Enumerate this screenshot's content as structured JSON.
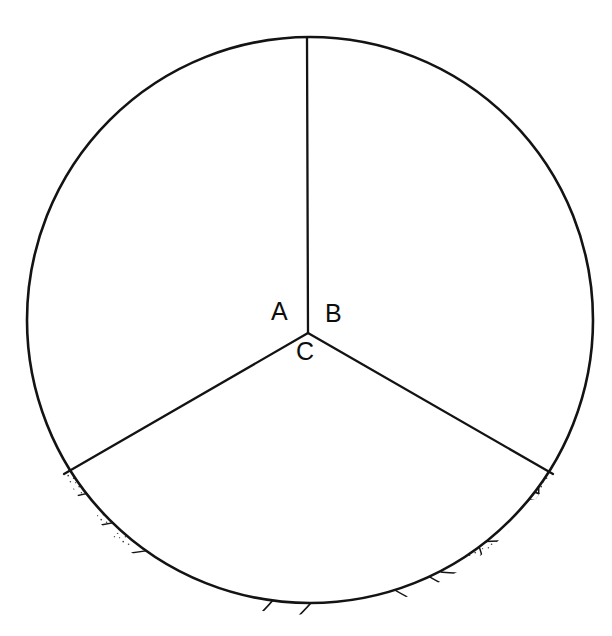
{
  "figure": {
    "kind": "microscopy-field-diagram",
    "title": "",
    "caption": "",
    "background_color": "#ffffff",
    "ink_color": "#131313",
    "field": {
      "shape": "circle",
      "center_x": 310,
      "center_y": 320,
      "radius": 284,
      "stroke_width": 2.6
    },
    "divider": {
      "junction_x": 308,
      "junction_y": 333,
      "arm_up_angle_deg": -90,
      "arm_lower_left_angle_deg": 150,
      "arm_lower_right_angle_deg": 30
    },
    "sectors": [
      {
        "id": "A",
        "label": "A",
        "label_x": 279,
        "label_y": 319,
        "content": "rod-shaped-bacilli",
        "description": "Segmented stippled rod-shaped bacilli scattered across the upper-left sector, some branched and curved.",
        "object_count": 28
      },
      {
        "id": "B",
        "label": "B",
        "label_x": 331,
        "label_y": 321,
        "content": "round-oval-cells",
        "description": "Round and oval stippled cells in the upper-right sector, several in budding pairs.",
        "object_count": 16
      },
      {
        "id": "C",
        "label": "C",
        "label_x": 301,
        "label_y": 359,
        "content": "septate-hyphae-with-conidiophore",
        "description": "Septate filamentous hyphae crossing the lower sector with a central branching conidiophore bearing four chains of conidia.",
        "hypha_count": 7,
        "conidia_chain_count": 4
      }
    ],
    "bacilli": [
      {
        "cx": 152,
        "cy": 113,
        "len": 26,
        "w": 10,
        "rot": -66,
        "seg": 3
      },
      {
        "cx": 213,
        "cy": 112,
        "len": 36,
        "w": 11,
        "rot": -8,
        "seg": 4
      },
      {
        "cx": 190,
        "cy": 134,
        "len": 62,
        "w": 12,
        "rot": 8,
        "seg": 6
      },
      {
        "cx": 232,
        "cy": 119,
        "len": 38,
        "w": 12,
        "rot": -62,
        "seg": 4
      },
      {
        "cx": 265,
        "cy": 118,
        "len": 50,
        "w": 12,
        "rot": -75,
        "seg": 5
      },
      {
        "cx": 284,
        "cy": 132,
        "len": 54,
        "w": 12,
        "rot": -80,
        "seg": 5
      },
      {
        "cx": 103,
        "cy": 159,
        "len": 40,
        "w": 12,
        "rot": -16,
        "seg": 4
      },
      {
        "cx": 120,
        "cy": 176,
        "len": 40,
        "w": 12,
        "rot": 60,
        "seg": 4
      },
      {
        "cx": 221,
        "cy": 182,
        "len": 36,
        "w": 12,
        "rot": -30,
        "seg": 4
      },
      {
        "cx": 160,
        "cy": 200,
        "len": 36,
        "w": 11,
        "rot": 72,
        "seg": 4
      },
      {
        "cx": 159,
        "cy": 226,
        "len": 30,
        "w": 11,
        "rot": 84,
        "seg": 3
      },
      {
        "cx": 212,
        "cy": 210,
        "len": 24,
        "w": 10,
        "rot": 66,
        "seg": 3
      },
      {
        "cx": 240,
        "cy": 200,
        "len": 38,
        "w": 12,
        "rot": 34,
        "seg": 4
      },
      {
        "cx": 264,
        "cy": 206,
        "len": 44,
        "w": 12,
        "rot": -20,
        "seg": 4
      },
      {
        "cx": 255,
        "cy": 225,
        "len": 34,
        "w": 12,
        "rot": 64,
        "seg": 3
      },
      {
        "cx": 70,
        "cy": 236,
        "len": 36,
        "w": 12,
        "rot": -22,
        "seg": 4
      },
      {
        "cx": 118,
        "cy": 242,
        "len": 20,
        "w": 10,
        "rot": 12,
        "seg": 2
      },
      {
        "cx": 54,
        "cy": 270,
        "len": 38,
        "w": 12,
        "rot": 20,
        "seg": 4
      },
      {
        "cx": 86,
        "cy": 265,
        "len": 36,
        "w": 12,
        "rot": -38,
        "seg": 4
      },
      {
        "cx": 92,
        "cy": 290,
        "len": 40,
        "w": 12,
        "rot": 66,
        "seg": 4
      },
      {
        "cx": 188,
        "cy": 247,
        "len": 44,
        "w": 12,
        "rot": 40,
        "seg": 4
      },
      {
        "cx": 172,
        "cy": 276,
        "len": 40,
        "w": 12,
        "rot": -14,
        "seg": 4
      },
      {
        "cx": 157,
        "cy": 294,
        "len": 22,
        "w": 11,
        "rot": 70,
        "seg": 2
      },
      {
        "cx": 238,
        "cy": 262,
        "len": 38,
        "w": 12,
        "rot": 66,
        "seg": 4
      },
      {
        "cx": 241,
        "cy": 296,
        "len": 20,
        "w": 10,
        "rot": 70,
        "seg": 2
      },
      {
        "cx": 287,
        "cy": 265,
        "len": 34,
        "w": 12,
        "rot": 32,
        "seg": 3
      },
      {
        "cx": 296,
        "cy": 290,
        "len": 38,
        "w": 12,
        "rot": 64,
        "seg": 4
      },
      {
        "cx": 170,
        "cy": 353,
        "len": 24,
        "w": 12,
        "rot": 30,
        "seg": 3
      }
    ],
    "bacilli_chains": [
      {
        "points": "70,343 74,368 90,382 112,376",
        "w": 13
      },
      {
        "points": "112,376 104,400 112,424 126,436",
        "w": 13
      },
      {
        "points": "112,376 132,362 150,356",
        "w": 13
      },
      {
        "points": "126,436 118,458 98,470",
        "w": 13
      },
      {
        "points": "112,424 134,420 146,404",
        "w": 13
      }
    ],
    "cells": [
      {
        "cx": 372,
        "cy": 96,
        "rx": 22,
        "ry": 20,
        "rot": -14,
        "bud": {
          "dx": 22,
          "dy": -10,
          "rx": 12,
          "ry": 11
        }
      },
      {
        "cx": 451,
        "cy": 106,
        "rx": 15,
        "ry": 14,
        "rot": 0,
        "bud": null
      },
      {
        "cx": 416,
        "cy": 155,
        "rx": 19,
        "ry": 18,
        "rot": 8,
        "bud": null
      },
      {
        "cx": 450,
        "cy": 162,
        "rx": 9,
        "ry": 8,
        "rot": 0,
        "bud": null
      },
      {
        "cx": 440,
        "cy": 194,
        "rx": 14,
        "ry": 13,
        "rot": 0,
        "bud": null
      },
      {
        "cx": 341,
        "cy": 200,
        "rx": 17,
        "ry": 15,
        "rot": -10,
        "bud": null
      },
      {
        "cx": 512,
        "cy": 219,
        "rx": 18,
        "ry": 16,
        "rot": 6,
        "bud": null
      },
      {
        "cx": 455,
        "cy": 235,
        "rx": 11,
        "ry": 10,
        "rot": 0,
        "bud": null
      },
      {
        "cx": 357,
        "cy": 267,
        "rx": 23,
        "ry": 20,
        "rot": -8,
        "bud": {
          "dx": 26,
          "dy": -6,
          "rx": 14,
          "ry": 13
        }
      },
      {
        "cx": 469,
        "cy": 289,
        "rx": 20,
        "ry": 18,
        "rot": 22,
        "bud": {
          "dx": -10,
          "dy": 22,
          "rx": 15,
          "ry": 13
        }
      },
      {
        "cx": 410,
        "cy": 330,
        "rx": 17,
        "ry": 16,
        "rot": 0,
        "bud": null
      },
      {
        "cx": 551,
        "cy": 323,
        "rx": 15,
        "ry": 14,
        "rot": 0,
        "bud": null
      },
      {
        "cx": 517,
        "cy": 373,
        "rx": 20,
        "ry": 19,
        "rot": 0,
        "bud": null
      },
      {
        "cx": 344,
        "cy": 341,
        "rx": 14,
        "ry": 13,
        "rot": 0,
        "bud": null
      }
    ],
    "conidiophore": {
      "stalk_base_x": 313,
      "stalk_base_y": 556,
      "stalk_top_x": 294,
      "stalk_top_y": 438,
      "chains": [
        {
          "angle_deg": -52,
          "length": 72,
          "spore_count": 6
        },
        {
          "angle_deg": -74,
          "length": 80,
          "spore_count": 6
        },
        {
          "angle_deg": -94,
          "length": 82,
          "spore_count": 6
        },
        {
          "angle_deg": -112,
          "length": 70,
          "spore_count": 5
        }
      ]
    }
  }
}
